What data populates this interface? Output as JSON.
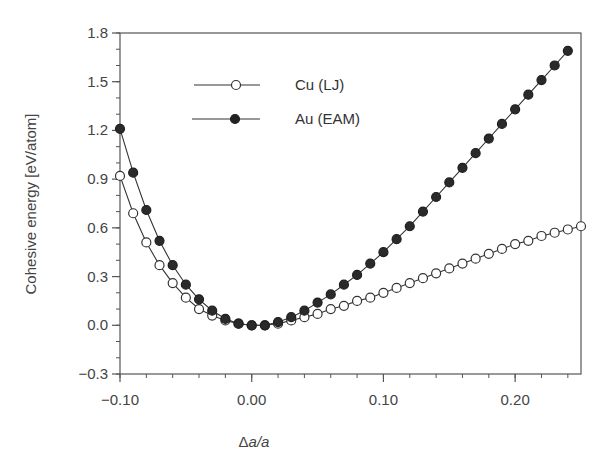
{
  "chart_data": {
    "type": "line",
    "title": "",
    "xlabel": "Δa/a",
    "ylabel": "Cohesive energy [eV/atom]",
    "xlim": [
      -0.1,
      0.25
    ],
    "ylim": [
      -0.3,
      1.8
    ],
    "grid": false,
    "legend_position": "upper-left-inside",
    "x_ticks": [
      -0.1,
      0.0,
      0.1,
      0.2
    ],
    "x_tick_labels": [
      "−0.10",
      "0.00",
      "0.10",
      "0.20"
    ],
    "x_minor_step": 0.02,
    "y_ticks": [
      -0.3,
      0.0,
      0.3,
      0.6,
      0.9,
      1.2,
      1.5,
      1.8
    ],
    "y_tick_labels": [
      "−0.3",
      "0.0",
      "0.3",
      "0.6",
      "0.9",
      "1.2",
      "1.5",
      "1.8"
    ],
    "y_minor_step": 0.1,
    "series": [
      {
        "name": "Cu (LJ)",
        "marker": "open-circle",
        "x": [
          -0.1,
          -0.09,
          -0.08,
          -0.07,
          -0.06,
          -0.05,
          -0.04,
          -0.03,
          -0.02,
          -0.01,
          0.0,
          0.01,
          0.02,
          0.03,
          0.04,
          0.05,
          0.06,
          0.07,
          0.08,
          0.09,
          0.1,
          0.11,
          0.12,
          0.13,
          0.14,
          0.15,
          0.16,
          0.17,
          0.18,
          0.19,
          0.2,
          0.21,
          0.22,
          0.23,
          0.24,
          0.25
        ],
        "values": [
          0.92,
          0.69,
          0.51,
          0.37,
          0.26,
          0.17,
          0.1,
          0.06,
          0.03,
          0.01,
          0.0,
          0.0,
          0.01,
          0.03,
          0.05,
          0.07,
          0.1,
          0.12,
          0.15,
          0.17,
          0.2,
          0.23,
          0.26,
          0.29,
          0.32,
          0.35,
          0.38,
          0.41,
          0.44,
          0.47,
          0.5,
          0.52,
          0.55,
          0.57,
          0.59,
          0.61
        ]
      },
      {
        "name": "Au (EAM)",
        "marker": "filled-circle",
        "x": [
          -0.1,
          -0.09,
          -0.08,
          -0.07,
          -0.06,
          -0.05,
          -0.04,
          -0.03,
          -0.02,
          -0.01,
          0.0,
          0.01,
          0.02,
          0.03,
          0.04,
          0.05,
          0.06,
          0.07,
          0.08,
          0.09,
          0.1,
          0.11,
          0.12,
          0.13,
          0.14,
          0.15,
          0.16,
          0.17,
          0.18,
          0.19,
          0.2,
          0.21,
          0.22,
          0.23,
          0.24
        ],
        "values": [
          1.21,
          0.94,
          0.71,
          0.52,
          0.37,
          0.25,
          0.16,
          0.09,
          0.04,
          0.01,
          0.0,
          0.0,
          0.02,
          0.05,
          0.09,
          0.14,
          0.19,
          0.25,
          0.31,
          0.38,
          0.45,
          0.53,
          0.61,
          0.7,
          0.79,
          0.88,
          0.97,
          1.06,
          1.15,
          1.24,
          1.33,
          1.42,
          1.51,
          1.6,
          1.69
        ]
      }
    ]
  },
  "legend": {
    "items": [
      {
        "label": "Cu (LJ)",
        "marker": "open-circle"
      },
      {
        "label": "Au (EAM)",
        "marker": "filled-circle"
      }
    ]
  },
  "axes": {
    "xlabel_prefix": "Δ",
    "xlabel_italic": "a/a",
    "ylabel": "Cohesive energy [eV/atom]"
  }
}
